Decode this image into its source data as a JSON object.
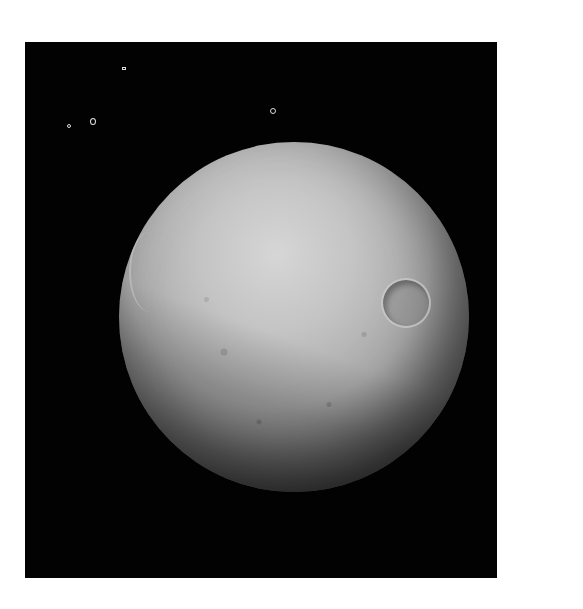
{
  "image": {
    "subject": "cratered icy moon",
    "background_color": "#020202",
    "border_color": "#ffffff",
    "moon_color": "#c4c4c4",
    "features": {
      "large_crater": "crater on right side of disk",
      "limb_crater": "basin on left limb"
    },
    "stars": [
      {
        "x": 98,
        "y": 26
      },
      {
        "x": 68,
        "y": 80
      },
      {
        "x": 248,
        "y": 66
      },
      {
        "x": 70,
        "y": 85
      }
    ]
  }
}
